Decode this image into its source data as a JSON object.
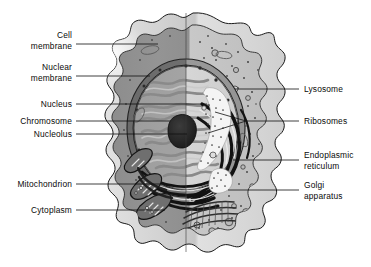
{
  "figure": {
    "subject": "cell",
    "background_color": "#ffffff",
    "line_color": "#111111",
    "split_note": "vertical mid-line divides shaded left half from lighter right half"
  },
  "labels_left": [
    {
      "id": "cell-membrane",
      "text": "Cell\nmembrane",
      "x": 12,
      "y": 30,
      "line": {
        "x1": 76,
        "y1": 44,
        "x2": 158,
        "y2": 44
      }
    },
    {
      "id": "nuclear-membrane",
      "text": "Nuclear\nmembrane",
      "x": 12,
      "y": 62,
      "line": {
        "x1": 76,
        "y1": 76,
        "x2": 150,
        "y2": 76
      }
    },
    {
      "id": "nucleus",
      "text": "Nucleus",
      "x": 12,
      "y": 100,
      "line": {
        "x1": 76,
        "y1": 104,
        "x2": 207,
        "y2": 104
      }
    },
    {
      "id": "chromosome",
      "text": "Chromosome",
      "x": 12,
      "y": 117,
      "line": {
        "x1": 76,
        "y1": 121,
        "x2": 170,
        "y2": 121
      }
    },
    {
      "id": "nucleolus",
      "text": "Nucleolus",
      "x": 12,
      "y": 130,
      "line": {
        "x1": 76,
        "y1": 134,
        "x2": 187,
        "y2": 134
      }
    },
    {
      "id": "mitochondrion",
      "text": "Mitochondrion",
      "x": 12,
      "y": 180,
      "line": {
        "x1": 76,
        "y1": 184,
        "x2": 162,
        "y2": 184
      }
    },
    {
      "id": "cytoplasm",
      "text": "Cytoplasm",
      "x": 12,
      "y": 206,
      "line": {
        "x1": 76,
        "y1": 210,
        "x2": 165,
        "y2": 210
      }
    }
  ],
  "labels_right": [
    {
      "id": "lysosome",
      "text": "Lysosome",
      "x": 305,
      "y": 85,
      "line": {
        "x1": 299,
        "y1": 89,
        "x2": 235,
        "y2": 89
      }
    },
    {
      "id": "ribosomes",
      "text": "Ribosomes",
      "x": 305,
      "y": 117,
      "line": {
        "x1": 299,
        "y1": 121,
        "x2": 246,
        "y2": 121
      }
    },
    {
      "id": "endoplasmic-reticulum",
      "text": "Endoplasmic\nreticulum",
      "x": 305,
      "y": 156,
      "line": {
        "x1": 299,
        "y1": 160,
        "x2": 233,
        "y2": 160
      }
    },
    {
      "id": "golgi-apparatus",
      "text": "Golgi\napparatus",
      "x": 305,
      "y": 186,
      "line": {
        "x1": 299,
        "y1": 190,
        "x2": 228,
        "y2": 190
      }
    }
  ],
  "ribosome_branch_lines": [
    {
      "x1": 246,
      "y1": 121,
      "x2": 215,
      "y2": 112
    },
    {
      "x1": 246,
      "y1": 121,
      "x2": 208,
      "y2": 133
    }
  ],
  "palette": {
    "membrane_outer_light": "#d9d9d9",
    "membrane_outer_dark": "#b8b8b8",
    "cytoplasm_left": "#8e8e8e",
    "cytoplasm_right": "#c2c2c2",
    "nucleus_left": "#9a9a9a",
    "nucleus_right": "#cdcdcd",
    "nuclear_envelope": "#6d6d6d",
    "nucleolus": "#2b2b2b",
    "er_dark": "#1e1e1e",
    "ribosome_white": "#f2f2f2",
    "golgi": "#555555",
    "outline": "#121212"
  }
}
